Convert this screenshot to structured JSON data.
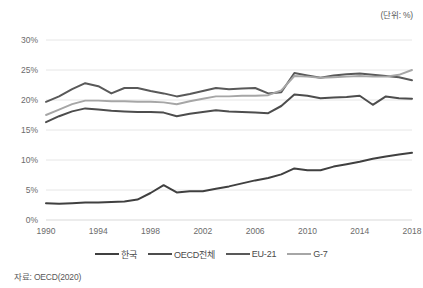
{
  "unit_label": "(단위: %)",
  "source_note": "자료: OECD(2020)",
  "legend": {
    "items": [
      {
        "label": "한국",
        "color": "#404040",
        "width": 2.2
      },
      {
        "label": "OECD전체",
        "color": "#4d4d4d",
        "width": 2.2
      },
      {
        "label": "EU-21",
        "color": "#595959",
        "width": 2.2
      },
      {
        "label": "G-7",
        "color": "#a6a6a6",
        "width": 2.0
      }
    ]
  },
  "axes": {
    "y_ticks": [
      "0%",
      "5%",
      "10%",
      "15%",
      "20%",
      "25%",
      "30%"
    ],
    "x_ticks": [
      "1990",
      "1994",
      "1998",
      "2002",
      "2006",
      "2010",
      "2014",
      "2018"
    ]
  },
  "chart_data": {
    "type": "line",
    "title": "",
    "subtitle": "",
    "xlabel": "",
    "ylabel": "",
    "unit": "%",
    "source": "자료: OECD(2020)",
    "grid": true,
    "legend_position": "bottom",
    "xlim": [
      1990,
      2018
    ],
    "ylim": [
      0,
      30
    ],
    "y_tick_values": [
      0,
      5,
      10,
      15,
      20,
      25,
      30
    ],
    "x_tick_values": [
      1990,
      1994,
      1998,
      2002,
      2006,
      2010,
      2014,
      2018
    ],
    "x": [
      1990,
      1991,
      1992,
      1993,
      1994,
      1995,
      1996,
      1997,
      1998,
      1999,
      2000,
      2001,
      2002,
      2003,
      2004,
      2005,
      2006,
      2007,
      2008,
      2009,
      2010,
      2011,
      2012,
      2013,
      2014,
      2015,
      2016,
      2017,
      2018
    ],
    "series": [
      {
        "name": "한국",
        "color": "#404040",
        "values": [
          2.8,
          2.7,
          2.8,
          2.9,
          2.9,
          3.0,
          3.1,
          3.4,
          4.5,
          5.8,
          4.6,
          4.8,
          4.8,
          5.2,
          5.6,
          6.1,
          6.6,
          7.0,
          7.6,
          8.6,
          8.3,
          8.3,
          8.9,
          9.3,
          9.7,
          10.2,
          10.6,
          10.9,
          11.2
        ]
      },
      {
        "name": "OECD전체",
        "color": "#4d4d4d",
        "values": [
          16.3,
          17.3,
          18.1,
          18.6,
          18.4,
          18.2,
          18.1,
          18.0,
          18.0,
          17.9,
          17.3,
          17.7,
          18.0,
          18.3,
          18.1,
          18.0,
          17.9,
          17.8,
          19.0,
          20.9,
          20.7,
          20.3,
          20.4,
          20.5,
          20.7,
          19.2,
          20.6,
          20.3,
          20.2
        ]
      },
      {
        "name": "EU-21",
        "color": "#595959",
        "values": [
          19.7,
          20.6,
          21.8,
          22.8,
          22.3,
          21.1,
          22.0,
          22.0,
          21.5,
          21.1,
          20.6,
          21.0,
          21.5,
          22.0,
          21.8,
          21.9,
          22.0,
          21.1,
          21.3,
          24.5,
          24.1,
          23.7,
          24.1,
          24.3,
          24.4,
          24.2,
          24.0,
          23.8,
          23.3
        ]
      },
      {
        "name": "G-7",
        "color": "#a6a6a6",
        "values": [
          17.5,
          18.4,
          19.3,
          19.9,
          19.9,
          19.8,
          19.8,
          19.7,
          19.7,
          19.6,
          19.3,
          19.8,
          20.2,
          20.6,
          20.6,
          20.7,
          20.7,
          20.8,
          21.6,
          24.0,
          23.9,
          23.7,
          23.8,
          23.9,
          24.0,
          23.9,
          23.9,
          24.2,
          25.0
        ]
      }
    ]
  }
}
